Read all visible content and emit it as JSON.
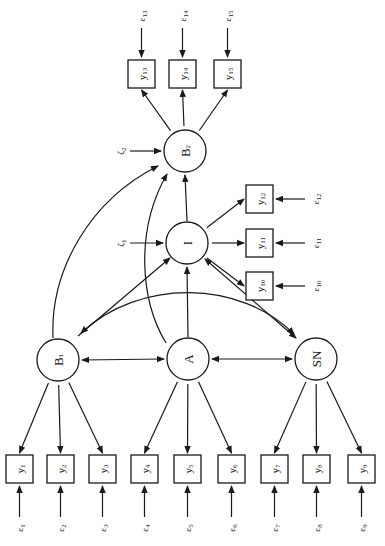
{
  "diagram": {
    "type": "structural-equation-path-diagram",
    "orientation": "rotated -90deg",
    "latent_variables": [
      {
        "id": "B1",
        "label": "B",
        "sub": "1",
        "cx": 58,
        "cy": 360
      },
      {
        "id": "A",
        "label": "A",
        "sub": "",
        "cx": 188,
        "cy": 359
      },
      {
        "id": "SN",
        "label": "SN",
        "sub": "",
        "cx": 316,
        "cy": 359
      },
      {
        "id": "I",
        "label": "I",
        "sub": "",
        "cx": 187,
        "cy": 243
      },
      {
        "id": "B2",
        "label": "B",
        "sub": "2",
        "cx": 185,
        "cy": 151
      }
    ],
    "observed_variables": [
      {
        "id": "y1",
        "label": "y",
        "sub": "1",
        "x": 6,
        "y": 455,
        "factor": "B1"
      },
      {
        "id": "y2",
        "label": "y",
        "sub": "2",
        "x": 47,
        "y": 455,
        "factor": "B1"
      },
      {
        "id": "y3",
        "label": "y",
        "sub": "3",
        "x": 89,
        "y": 455,
        "factor": "B1"
      },
      {
        "id": "y4",
        "label": "y",
        "sub": "4",
        "x": 131,
        "y": 455,
        "factor": "A"
      },
      {
        "id": "y5",
        "label": "y",
        "sub": "5",
        "x": 174,
        "y": 455,
        "factor": "A"
      },
      {
        "id": "y6",
        "label": "y",
        "sub": "6",
        "x": 218,
        "y": 455,
        "factor": "A"
      },
      {
        "id": "y7",
        "label": "y",
        "sub": "7",
        "x": 261,
        "y": 455,
        "factor": "SN"
      },
      {
        "id": "y8",
        "label": "y",
        "sub": "8",
        "x": 303,
        "y": 455,
        "factor": "SN"
      },
      {
        "id": "y9",
        "label": "y",
        "sub": "9",
        "x": 348,
        "y": 455,
        "factor": "SN"
      },
      {
        "id": "y10",
        "label": "y",
        "sub": "10",
        "x": 246,
        "y": 272,
        "factor": "I"
      },
      {
        "id": "y11",
        "label": "y",
        "sub": "11",
        "x": 246,
        "y": 229,
        "factor": "I"
      },
      {
        "id": "y12",
        "label": "y",
        "sub": "12",
        "x": 246,
        "y": 185,
        "factor": "I"
      },
      {
        "id": "y13",
        "label": "y",
        "sub": "13",
        "x": 128,
        "y": 60,
        "factor": "B2"
      },
      {
        "id": "y14",
        "label": "y",
        "sub": "14",
        "x": 169,
        "y": 60,
        "factor": "B2"
      },
      {
        "id": "y15",
        "label": "y",
        "sub": "15",
        "x": 214,
        "y": 60,
        "factor": "B2"
      }
    ],
    "error_terms": [
      {
        "id": "e1",
        "label": "ε",
        "sub": "1",
        "target": "y1"
      },
      {
        "id": "e2",
        "label": "ε",
        "sub": "2",
        "target": "y2"
      },
      {
        "id": "e3",
        "label": "ε",
        "sub": "3",
        "target": "y3"
      },
      {
        "id": "e4",
        "label": "ε",
        "sub": "4",
        "target": "y4"
      },
      {
        "id": "e5",
        "label": "ε",
        "sub": "5",
        "target": "y5"
      },
      {
        "id": "e6",
        "label": "ε",
        "sub": "6",
        "target": "y6"
      },
      {
        "id": "e7",
        "label": "ε",
        "sub": "7",
        "target": "y7"
      },
      {
        "id": "e8",
        "label": "ε",
        "sub": "8",
        "target": "y8"
      },
      {
        "id": "e9",
        "label": "ε",
        "sub": "9",
        "target": "y9"
      },
      {
        "id": "e10",
        "label": "ε",
        "sub": "10",
        "target": "y10"
      },
      {
        "id": "e11",
        "label": "ε",
        "sub": "11",
        "target": "y11"
      },
      {
        "id": "e12",
        "label": "ε",
        "sub": "12",
        "target": "y12"
      },
      {
        "id": "e13",
        "label": "ε",
        "sub": "13",
        "target": "y13"
      },
      {
        "id": "e14",
        "label": "ε",
        "sub": "14",
        "target": "y14"
      },
      {
        "id": "e15",
        "label": "ε",
        "sub": "15",
        "target": "y15"
      }
    ],
    "disturbances": [
      {
        "id": "zeta1",
        "label": "ζ",
        "sub": "1",
        "target": "I"
      },
      {
        "id": "zeta2",
        "label": "ζ",
        "sub": "2",
        "target": "B2"
      }
    ],
    "paths": [
      {
        "from": "B1",
        "to": "I",
        "type": "directed"
      },
      {
        "from": "A",
        "to": "I",
        "type": "directed"
      },
      {
        "from": "SN",
        "to": "I",
        "type": "directed"
      },
      {
        "from": "I",
        "to": "B2",
        "type": "directed"
      },
      {
        "from": "B1",
        "to": "B2",
        "type": "directed-curved"
      },
      {
        "from": "A",
        "to": "B2",
        "type": "directed-curved"
      },
      {
        "from": "B1",
        "to": "A",
        "type": "covariance"
      },
      {
        "from": "A",
        "to": "SN",
        "type": "covariance"
      },
      {
        "from": "B1",
        "to": "SN",
        "type": "covariance-curved"
      }
    ]
  }
}
